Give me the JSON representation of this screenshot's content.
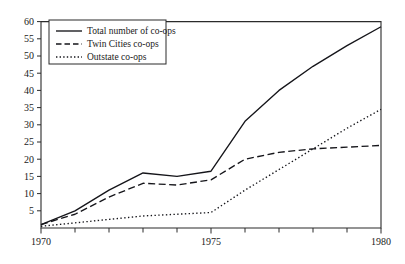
{
  "chart_data": {
    "type": "line",
    "title": "",
    "subtitle": "",
    "xlabel": "",
    "ylabel": "",
    "x": [
      1970,
      1971,
      1972,
      1973,
      1974,
      1975,
      1976,
      1977,
      1978,
      1979,
      1980
    ],
    "xlim": [
      1970,
      1980
    ],
    "ylim": [
      0,
      60
    ],
    "grid": false,
    "legend_position": "top-left",
    "x_tick_labels": [
      "1970",
      "1975",
      "1980"
    ],
    "x_tick_values": [
      1970,
      1975,
      1980
    ],
    "x_minor_tick_values": [
      1971,
      1972,
      1973,
      1974,
      1976,
      1977,
      1978,
      1979
    ],
    "y_tick_labels": [
      "5",
      "10",
      "15",
      "20",
      "25",
      "30",
      "35",
      "40",
      "45",
      "50",
      "55",
      "60"
    ],
    "y_tick_values": [
      5,
      10,
      15,
      20,
      25,
      30,
      35,
      40,
      45,
      50,
      55,
      60
    ],
    "series": [
      {
        "name": "Total number of co-ops",
        "style": "solid",
        "color": "#15151a",
        "values": [
          1,
          5,
          11,
          16,
          15,
          16.5,
          31,
          40,
          47,
          53,
          58.5
        ]
      },
      {
        "name": "Twin Cities co-ops",
        "style": "dashed",
        "color": "#15151a",
        "values": [
          1,
          4,
          9,
          13,
          12.5,
          14,
          20,
          22,
          23,
          23.5,
          24
        ]
      },
      {
        "name": "Outstate co-ops",
        "style": "dotted",
        "color": "#15151a",
        "values": [
          0.5,
          1.5,
          2.5,
          3.5,
          4,
          4.5,
          11,
          17,
          23,
          29,
          34.5
        ]
      }
    ]
  },
  "legend": {
    "items": [
      {
        "label": "Total number of co-ops",
        "style": "solid"
      },
      {
        "label": "Twin Cities co-ops",
        "style": "dashed"
      },
      {
        "label": "Outstate co-ops",
        "style": "dotted"
      }
    ]
  },
  "axes": {
    "y_labels": [
      "60",
      "55",
      "50",
      "45",
      "40",
      "35",
      "30",
      "25",
      "20",
      "15",
      "10",
      "5"
    ],
    "x_labels": [
      "1970",
      "1975",
      "1980"
    ]
  }
}
